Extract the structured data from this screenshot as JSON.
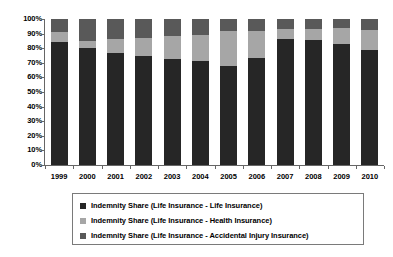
{
  "chart_data": {
    "type": "bar",
    "stacked": true,
    "stack_mode": "percent",
    "title": "",
    "subtitle": "",
    "xlabel": "",
    "ylabel": "",
    "ylim": [
      0,
      100
    ],
    "ytick_step": 10,
    "grid": false,
    "legend_position": "bottom",
    "categories": [
      "1999",
      "2000",
      "2001",
      "2002",
      "2003",
      "2004",
      "2005",
      "2006",
      "2007",
      "2008",
      "2009",
      "2010"
    ],
    "series": [
      {
        "name": "Indemnity Share (Life Insurance - Life Insurance)",
        "color": "#262626",
        "values": [
          84,
          80,
          77,
          75,
          72.5,
          71,
          67.5,
          73.5,
          86,
          85.5,
          83,
          78.5
        ]
      },
      {
        "name": "Indemnity Share (Life Insurance - Health Insurance)",
        "color": "#a6a6a6",
        "values": [
          7,
          5,
          9,
          12,
          16,
          18,
          24,
          18,
          7,
          8,
          11,
          14
        ]
      },
      {
        "name": "Indemnity Share (Life Insurance - Accidental Injury Insurance)",
        "color": "#595959",
        "values": [
          9,
          15,
          14,
          13,
          11.5,
          11,
          8.5,
          8.5,
          7,
          6.5,
          6,
          7.5
        ]
      }
    ],
    "ytick_labels": [
      "100%",
      "90%",
      "80%",
      "70%",
      "60%",
      "50%",
      "40%",
      "30%",
      "20%",
      "10%",
      "0%"
    ],
    "ytick_values": [
      100,
      90,
      80,
      70,
      60,
      50,
      40,
      30,
      20,
      10,
      0
    ]
  },
  "legend": {
    "entries": [
      {
        "label": "Indemnity Share (Life Insurance - Life Insurance)",
        "color": "#262626"
      },
      {
        "label": "Indemnity Share (Life Insurance - Health Insurance)",
        "color": "#a6a6a6"
      },
      {
        "label": "Indemnity Share (Life Insurance - Accidental Injury Insurance)",
        "color": "#595959"
      }
    ]
  }
}
